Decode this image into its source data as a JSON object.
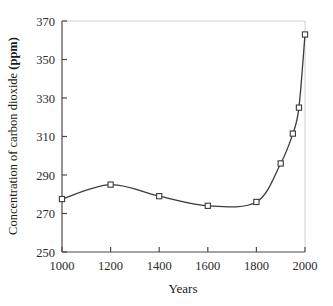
{
  "chart_data": {
    "type": "line",
    "title": "",
    "xlabel": "Years",
    "ylabel": "Concentration of carbon dioxide (ppm)",
    "ylabel_plain": "Concentration of carbon dioxide ",
    "ylabel_bold": "(ppm)",
    "xlim": [
      1000,
      2000
    ],
    "ylim": [
      250,
      370
    ],
    "xticks": [
      1000,
      1200,
      1400,
      1600,
      1800,
      2000
    ],
    "xtick_labels": [
      "1000",
      "1200",
      "1400",
      "1600",
      "1800",
      "2000"
    ],
    "yticks": [
      250,
      270,
      290,
      310,
      330,
      350,
      370
    ],
    "ytick_labels": [
      "250",
      "270",
      "290",
      "310",
      "330",
      "350",
      "370"
    ],
    "grid": false,
    "legend": null,
    "marker": "open-square",
    "line_color": "#3a3a3a",
    "marker_fill": "#ffffff",
    "marker_edge": "#3a3a3a",
    "x": [
      1000,
      1200,
      1400,
      1600,
      1800,
      1900,
      1950,
      1975,
      2000
    ],
    "values": [
      277.5,
      285.0,
      279.0,
      274.0,
      276.0,
      296.0,
      311.5,
      325.0,
      363.0
    ],
    "series": [
      {
        "name": "Atmospheric CO2 concentration",
        "points": [
          {
            "x": 1000,
            "y": 277.5
          },
          {
            "x": 1200,
            "y": 285.0
          },
          {
            "x": 1400,
            "y": 279.0
          },
          {
            "x": 1600,
            "y": 274.0
          },
          {
            "x": 1800,
            "y": 276.0
          },
          {
            "x": 1900,
            "y": 296.0
          },
          {
            "x": 1950,
            "y": 311.5
          },
          {
            "x": 1975,
            "y": 325.0
          },
          {
            "x": 2000,
            "y": 363.0
          }
        ]
      }
    ]
  }
}
